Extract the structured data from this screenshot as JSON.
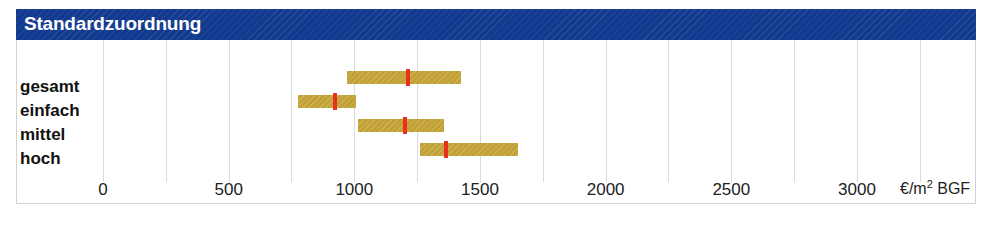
{
  "panel": {
    "title": "Standardzuordnung",
    "title_bg": "#123a8e",
    "frame_border": "#cfd3d8"
  },
  "axis": {
    "unit_label": "€/m² BGF",
    "unit_prefix": "€/m",
    "unit_sup": "2",
    "unit_suffix": " BGF",
    "tick_labels": [
      "0",
      "500",
      "1000",
      "1500",
      "2000",
      "2500",
      "3000"
    ],
    "tick_values": [
      0,
      500,
      1000,
      1500,
      2000,
      2500,
      3000
    ],
    "gridline_values": [
      0,
      250,
      500,
      750,
      1000,
      1250,
      1500,
      1750,
      2000,
      2250,
      2500,
      2750,
      3000,
      3250
    ],
    "min": 0,
    "max": 3430
  },
  "rows": [
    {
      "label": "gesamt"
    },
    {
      "label": "einfach"
    },
    {
      "label": "mittel"
    },
    {
      "label": "hoch"
    }
  ],
  "colors": {
    "bar": "#c2a236",
    "marker": "#e8301c",
    "grid": "#d8dadd",
    "text": "#111111"
  },
  "chart_data": {
    "type": "bar",
    "title": "Standardzuordnung",
    "xlabel": "€/m² BGF",
    "ylabel": "",
    "xlim": [
      0,
      3430
    ],
    "grid": true,
    "legend": "none",
    "orientation": "horizontal",
    "categories": [
      "gesamt",
      "einfach",
      "mittel",
      "hoch"
    ],
    "series": [
      {
        "name": "Spanne von",
        "values": [
          970,
          775,
          1015,
          1260
        ]
      },
      {
        "name": "Spanne bis",
        "values": [
          1425,
          1005,
          1355,
          1650
        ]
      },
      {
        "name": "Median",
        "values": [
          1215,
          925,
          1200,
          1365
        ]
      }
    ],
    "xticks": [
      0,
      500,
      1000,
      1500,
      2000,
      2500,
      3000
    ],
    "xticklabels": [
      "0",
      "500",
      "1000",
      "1500",
      "2000",
      "2500",
      "3000"
    ]
  }
}
